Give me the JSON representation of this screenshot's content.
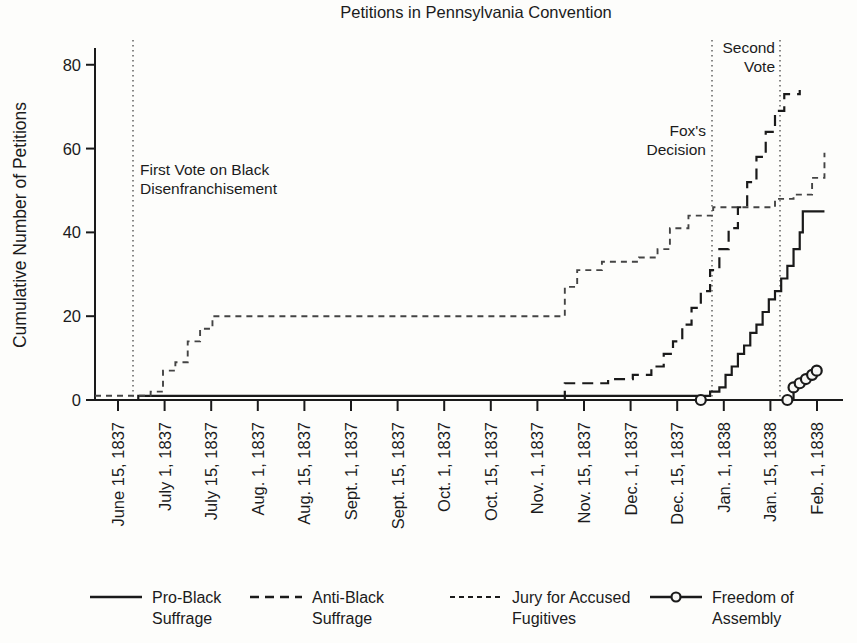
{
  "chart_data": {
    "type": "line",
    "title": "Petitions in Pennsylvania Convention",
    "xlabel": "",
    "ylabel": "Cumulative Number of Petitions",
    "ylim": [
      0,
      84
    ],
    "yticks": [
      0,
      20,
      40,
      60,
      80
    ],
    "grid": false,
    "legend_position": "bottom",
    "x_tick_labels": [
      "June 15, 1837",
      "July 1, 1837",
      "July 15, 1837",
      "Aug. 1, 1837",
      "Aug. 15, 1837",
      "Sept. 1, 1837",
      "Sept. 15, 1837",
      "Oct. 1, 1837",
      "Oct. 15, 1837",
      "Nov. 1, 1837",
      "Nov. 15, 1837",
      "Dec. 1, 1837",
      "Dec. 15, 1837",
      "Jan. 1, 1838",
      "Jan. 15, 1838",
      "Feb. 1, 1838"
    ],
    "x_range": [
      "June 8, 1837",
      "Feb. 5, 1838"
    ],
    "annotations": [
      {
        "label": "First Vote on Black Disenfranchisement",
        "x": "July 1, 1837",
        "style": "dotted-vertical"
      },
      {
        "label": "Fox's Decision",
        "x": "Jan. 1, 1838",
        "style": "dotted-vertical"
      },
      {
        "label": "Second Vote",
        "x": "Jan. 20, 1838",
        "style": "dotted-vertical"
      }
    ],
    "series": [
      {
        "name": "Pro-Black Suffrage",
        "style": "solid",
        "marker": "none",
        "color": "#1a1a1a",
        "points": [
          [
            0.0,
            0.0
          ],
          [
            13.0,
            0.0
          ],
          [
            14.0,
            1.0
          ],
          [
            190.0,
            1.0
          ],
          [
            196.0,
            1.0
          ],
          [
            199.0,
            2.0
          ],
          [
            202.0,
            3.0
          ],
          [
            204.0,
            6.0
          ],
          [
            206.0,
            8.0
          ],
          [
            208.0,
            11.0
          ],
          [
            210.0,
            13.0
          ],
          [
            212.0,
            16.0
          ],
          [
            214.0,
            18.0
          ],
          [
            216.0,
            21.0
          ],
          [
            218.0,
            24.0
          ],
          [
            220.0,
            26.0
          ],
          [
            222.0,
            29.0
          ],
          [
            224.0,
            32.0
          ],
          [
            226.0,
            36.0
          ],
          [
            228.0,
            40.0
          ],
          [
            229.0,
            45.0
          ],
          [
            236.0,
            45.0
          ]
        ]
      },
      {
        "name": "Anti-Black Suffrage",
        "style": "dashed",
        "marker": "none",
        "color": "#1a1a1a",
        "points": [
          [
            0.0,
            0.0
          ],
          [
            150.0,
            0.0
          ],
          [
            152.0,
            4.0
          ],
          [
            158.0,
            4.0
          ],
          [
            166.0,
            5.0
          ],
          [
            174.0,
            6.0
          ],
          [
            180.0,
            8.0
          ],
          [
            184.0,
            11.0
          ],
          [
            187.0,
            14.0
          ],
          [
            190.0,
            18.0
          ],
          [
            193.0,
            22.0
          ],
          [
            196.0,
            26.0
          ],
          [
            199.0,
            31.0
          ],
          [
            202.0,
            36.0
          ],
          [
            205.0,
            41.0
          ],
          [
            208.0,
            46.0
          ],
          [
            211.0,
            52.0
          ],
          [
            214.0,
            58.0
          ],
          [
            217.0,
            64.0
          ],
          [
            220.0,
            69.0
          ],
          [
            223.0,
            73.0
          ],
          [
            228.0,
            74.0
          ]
        ]
      },
      {
        "name": "Jury for Accused Fugitives",
        "style": "dotted-dash",
        "marker": "none",
        "color": "#444444",
        "points": [
          [
            0.0,
            1.0
          ],
          [
            14.0,
            1.0
          ],
          [
            18.0,
            2.0
          ],
          [
            22.0,
            7.0
          ],
          [
            26.0,
            9.0
          ],
          [
            30.0,
            14.0
          ],
          [
            34.0,
            17.0
          ],
          [
            38.0,
            20.0
          ],
          [
            150.0,
            20.0
          ],
          [
            152.0,
            27.0
          ],
          [
            156.0,
            31.0
          ],
          [
            164.0,
            33.0
          ],
          [
            176.0,
            34.0
          ],
          [
            182.0,
            36.0
          ],
          [
            186.0,
            41.0
          ],
          [
            192.0,
            44.0
          ],
          [
            200.0,
            46.0
          ],
          [
            214.0,
            46.0
          ],
          [
            220.0,
            48.0
          ],
          [
            226.0,
            49.0
          ],
          [
            232.0,
            53.0
          ],
          [
            236.0,
            59.0
          ]
        ]
      },
      {
        "name": "Freedom of Assembly",
        "style": "solid-marker",
        "marker": "circle",
        "color": "#1a1a1a",
        "points": [
          [
            0.0,
            0.0
          ],
          [
            196.0,
            0.0
          ],
          [
            224.0,
            0.0
          ],
          [
            226.0,
            3.0
          ],
          [
            228.0,
            4.0
          ],
          [
            230.0,
            5.0
          ],
          [
            232.0,
            6.0
          ],
          [
            233.5,
            7.0
          ]
        ]
      }
    ],
    "legend": [
      {
        "label_line1": "Pro-Black",
        "label_line2": "Suffrage",
        "style": "solid"
      },
      {
        "label_line1": "Anti-Black",
        "label_line2": "Suffrage",
        "style": "dashed"
      },
      {
        "label_line1": "Jury for Accused",
        "label_line2": "Fugitives",
        "style": "dotted-dash"
      },
      {
        "label_line1": "Freedom of",
        "label_line2": "Assembly",
        "style": "solid-marker"
      }
    ]
  }
}
